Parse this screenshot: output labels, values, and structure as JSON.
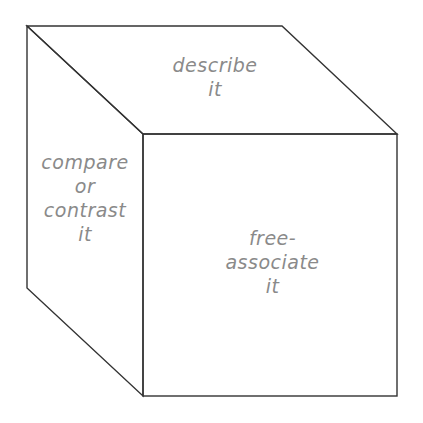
{
  "diagram": {
    "type": "cube",
    "faces": {
      "top": {
        "lines": [
          "describe",
          "it"
        ]
      },
      "left": {
        "lines": [
          "compare",
          "or",
          "contrast",
          "it"
        ]
      },
      "front": {
        "lines": [
          "free-",
          "associate",
          "it"
        ]
      }
    },
    "colors": {
      "line": "#333333",
      "text": "#8a8a8a",
      "background": "#ffffff"
    }
  }
}
